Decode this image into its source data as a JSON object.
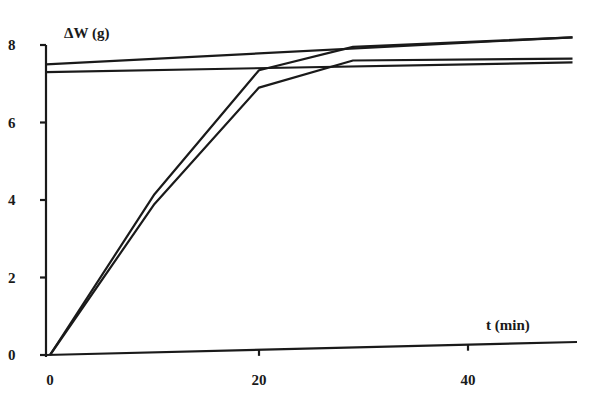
{
  "chart_data": {
    "type": "line",
    "title": "",
    "xlabel": "t (min)",
    "ylabel": "ΔW (g)",
    "xlim": [
      0,
      50
    ],
    "ylim": [
      0,
      8
    ],
    "x_ticks": [
      0,
      20,
      40
    ],
    "y_ticks": [
      0,
      2,
      4,
      6,
      8
    ],
    "grid": false,
    "legend": null,
    "series": [
      {
        "name": "curve-1",
        "x": [
          0,
          10,
          20,
          29,
          50
        ],
        "y": [
          0,
          4.15,
          7.35,
          7.95,
          8.2
        ]
      },
      {
        "name": "curve-2",
        "x": [
          0,
          10,
          20,
          29,
          50
        ],
        "y": [
          0,
          3.9,
          6.9,
          7.6,
          7.65
        ]
      },
      {
        "name": "asymptote-upper",
        "x": [
          0,
          50
        ],
        "y": [
          7.5,
          8.2
        ]
      },
      {
        "name": "asymptote-lower",
        "x": [
          0,
          50
        ],
        "y": [
          7.3,
          7.55
        ]
      }
    ]
  },
  "axes": {
    "x_label": "t (min)",
    "y_label": "ΔW (g)",
    "x_tick_labels": [
      "0",
      "20",
      "40"
    ],
    "y_tick_labels": [
      "0",
      "2",
      "4",
      "6",
      "8"
    ]
  },
  "style": {
    "line_color": "#1a1a1a",
    "background": "#ffffff"
  }
}
